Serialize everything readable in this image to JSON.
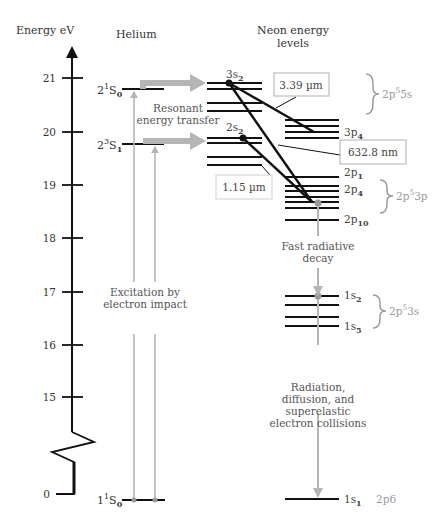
{
  "axis": {
    "title": "Energy eV",
    "ticks": [
      {
        "label": "21",
        "y": 78
      },
      {
        "label": "20",
        "y": 132
      },
      {
        "label": "19",
        "y": 185
      },
      {
        "label": "18",
        "y": 238
      },
      {
        "label": "17",
        "y": 292
      },
      {
        "label": "16",
        "y": 345
      },
      {
        "label": "15",
        "y": 397
      },
      {
        "label": "0",
        "y": 494
      }
    ]
  },
  "helium": {
    "title": "Helium",
    "levels": [
      {
        "label_main": "2",
        "label_sup": "1",
        "label_rest": "S",
        "label_sub": "0",
        "y": 89
      },
      {
        "label_main": "2",
        "label_sup": "3",
        "label_rest": "S",
        "label_sub": "1",
        "y": 144
      },
      {
        "label_main": "1",
        "label_sup": "1",
        "label_rest": "S",
        "label_sub": "0",
        "y": 500
      }
    ],
    "excitation_label": [
      "Excitation by",
      "electron impact"
    ],
    "transfer_label": [
      "Resonant",
      "energy transfer"
    ]
  },
  "neon": {
    "title": [
      "Neon energy",
      "levels"
    ],
    "labels": {
      "s3": {
        "main": "3s",
        "sub": "2"
      },
      "s2": {
        "main": "2s",
        "sub": "2"
      },
      "p3_4": {
        "main": "3p",
        "sub": "4"
      },
      "p2_1": {
        "main": "2p",
        "sub": "1"
      },
      "p2_4": {
        "main": "2p",
        "sub": "4"
      },
      "p2_10": {
        "main": "2p",
        "sub": "10"
      },
      "s1_2": {
        "main": "1s",
        "sub": "2"
      },
      "s1_5": {
        "main": "1s",
        "sub": "5"
      },
      "s1_1": {
        "main": "1s",
        "sub": "1"
      }
    },
    "groups": {
      "g5s": {
        "main": "2p",
        "sup": "5",
        "rest": "5s"
      },
      "g3p": {
        "main": "2p",
        "sup": "5",
        "rest": "3p"
      },
      "g3s": {
        "main": "2p",
        "sup": "5",
        "rest": "3s"
      },
      "ground": "2p6"
    },
    "fast_decay_label": [
      "Fast radiative",
      "decay"
    ],
    "radiation_label": [
      "Radiation,",
      "diffusion, and",
      "superelastic",
      "electron collisions"
    ]
  },
  "transitions": {
    "t339": "3.39 µm",
    "t6328": "632.8 nm",
    "t115": "1.15 µm"
  },
  "colors": {
    "line": "#111111",
    "grey_arrow": "#b5b5b5",
    "grey_text": "#9a9a9a",
    "box_border": "#b0b0b0",
    "decay_dot": "#9a9a9a"
  }
}
